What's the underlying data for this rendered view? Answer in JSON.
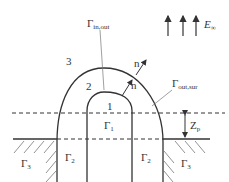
{
  "diagram": {
    "field_label": {
      "symbol": "E",
      "subscript": "∞"
    },
    "regions": {
      "region_1": "1",
      "region_2": "2",
      "region_3": "3"
    },
    "boundaries": {
      "gamma_in_out": {
        "symbol": "Γ",
        "subscript": "in,out"
      },
      "gamma_out_sur": {
        "symbol": "Γ",
        "subscript": "out,sur"
      },
      "gamma_1": {
        "symbol": "Γ",
        "subscript": "1"
      },
      "gamma_2_left": {
        "symbol": "Γ",
        "subscript": "2"
      },
      "gamma_2_right": {
        "symbol": "Γ",
        "subscript": "2"
      },
      "gamma_3_left": {
        "symbol": "Γ",
        "subscript": "3"
      },
      "gamma_3_right": {
        "symbol": "Γ",
        "subscript": "3"
      }
    },
    "normals": {
      "inner": "n",
      "outer": "n"
    },
    "depth_label": {
      "symbol": "Z",
      "subscript": "p"
    },
    "colors": {
      "line": "#333333",
      "hatch": "#777777",
      "background": "#ffffff"
    }
  }
}
